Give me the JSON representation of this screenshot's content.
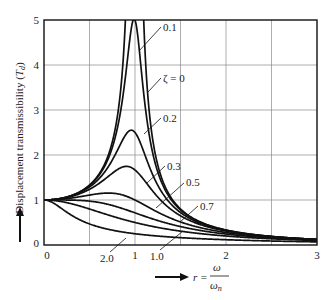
{
  "chart_data": {
    "type": "line",
    "title": "",
    "xlabel": "r = ω/ω_n",
    "xlabel_parts": {
      "lhs": "r =",
      "num": "ω",
      "den": "ω",
      "den_sub": "n"
    },
    "ylabel": "Displacement transmissibility (T_d)",
    "ylabel_parts": {
      "main": "Displacement transmissibility (",
      "sym": "T",
      "sub": "d",
      "close": ")"
    },
    "xlim": [
      0,
      3
    ],
    "ylim": [
      0,
      5
    ],
    "grid": true,
    "x_ticks": [
      {
        "v": 0,
        "label": "0"
      },
      {
        "v": 1,
        "label": "1"
      },
      {
        "v": 2,
        "label": "2"
      },
      {
        "v": 3,
        "label": "3"
      }
    ],
    "x_gridlines": [
      0.5,
      1,
      1.5,
      2,
      2.5
    ],
    "y_ticks": [
      {
        "v": 0,
        "label": "0"
      },
      {
        "v": 1,
        "label": "1"
      },
      {
        "v": 2,
        "label": "2"
      },
      {
        "v": 3,
        "label": "3"
      },
      {
        "v": 4,
        "label": "4"
      },
      {
        "v": 5,
        "label": "5"
      }
    ],
    "y_gridlines": [
      1,
      2,
      3,
      4
    ],
    "x": [
      0,
      0.25,
      0.5,
      0.75,
      1.0,
      1.25,
      1.5,
      2.0,
      2.5,
      3.0
    ],
    "series": [
      {
        "name": "ζ = 0",
        "zeta": 0,
        "values": [
          1,
          1.067,
          1.333,
          2.286,
          null,
          1.778,
          0.8,
          0.333,
          0.19,
          0.125
        ]
      },
      {
        "name": "0.1",
        "zeta": 0.1,
        "values": [
          1,
          1.066,
          1.322,
          2.162,
          5.0,
          1.625,
          0.778,
          0.33,
          0.19,
          0.125
        ]
      },
      {
        "name": "0.2",
        "zeta": 0.2,
        "values": [
          1,
          1.061,
          1.289,
          1.885,
          2.5,
          1.329,
          0.721,
          0.322,
          0.187,
          0.124
        ]
      },
      {
        "name": "0.3",
        "zeta": 0.3,
        "values": [
          1,
          1.053,
          1.238,
          1.593,
          1.667,
          1.067,
          0.649,
          0.309,
          0.183,
          0.122
        ]
      },
      {
        "name": "0.5",
        "zeta": 0.5,
        "values": [
          1,
          1.033,
          1.109,
          1.152,
          1.0,
          0.73,
          0.512,
          0.277,
          0.172,
          0.117
        ]
      },
      {
        "name": "0.7",
        "zeta": 0.7,
        "values": [
          1,
          1.009,
          0.975,
          0.879,
          0.714,
          0.544,
          0.409,
          0.244,
          0.158,
          0.111
        ]
      },
      {
        "name": "1.0",
        "zeta": 1.0,
        "values": [
          1,
          0.941,
          0.8,
          0.64,
          0.5,
          0.39,
          0.308,
          0.2,
          0.138,
          0.1
        ]
      },
      {
        "name": "2.0",
        "zeta": 2.0,
        "values": [
          1,
          0.74,
          0.468,
          0.33,
          0.25,
          0.199,
          0.163,
          0.118,
          0.089,
          0.071
        ]
      }
    ],
    "annotations": [
      {
        "text": "0.1",
        "zeta": 0.1,
        "label_x": 163,
        "label_y": 31,
        "line": [
          [
            161,
            27
          ],
          [
            139,
            51
          ]
        ]
      },
      {
        "text": "ζ = 0",
        "zeta": 0,
        "label_x": 163,
        "label_y": 82,
        "line": [
          [
            161,
            78
          ],
          [
            148,
            92
          ]
        ]
      },
      {
        "text": "0.2",
        "zeta": 0.2,
        "label_x": 163,
        "label_y": 122,
        "line": [
          [
            161,
            118
          ],
          [
            144,
            134
          ]
        ]
      },
      {
        "text": "0.3",
        "zeta": 0.3,
        "label_x": 167,
        "label_y": 170,
        "line": [
          [
            165,
            166
          ],
          [
            147,
            183
          ]
        ]
      },
      {
        "text": "0.5",
        "zeta": 0.5,
        "label_x": 186,
        "label_y": 186,
        "line": [
          [
            184,
            183
          ],
          [
            156,
            208
          ]
        ]
      },
      {
        "text": "0.7",
        "zeta": 0.7,
        "label_x": 200,
        "label_y": 210,
        "line": [
          [
            198,
            206
          ],
          [
            180,
            222
          ]
        ]
      },
      {
        "text": "1.0",
        "zeta": 1.0,
        "label_x": 150,
        "label_y": 260,
        "line": [
          [
            160,
            250
          ],
          [
            183,
            231
          ]
        ]
      },
      {
        "text": "2.0",
        "zeta": 2.0,
        "label_x": 100,
        "label_y": 262,
        "line": [
          [
            110,
            252
          ],
          [
            126,
            238
          ]
        ]
      }
    ],
    "legend": null
  }
}
